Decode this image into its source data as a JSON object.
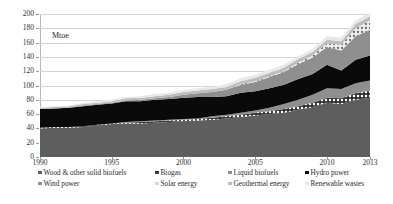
{
  "chart_data": {
    "type": "area",
    "stacked": true,
    "title": "",
    "unit_label": "Mtoe",
    "xlabel": "",
    "ylabel": "",
    "ylim": [
      0,
      200
    ],
    "ytick_step": 20,
    "ytick_labels": [
      "200",
      "180",
      "160",
      "140",
      "120",
      "100",
      "80",
      "60",
      "40",
      "20",
      "0"
    ],
    "ytick_values": [
      200,
      180,
      160,
      140,
      120,
      100,
      80,
      60,
      40,
      20,
      0
    ],
    "xlim": [
      1990,
      2013
    ],
    "xtick_labels": [
      "1990",
      "1995",
      "2000",
      "2005",
      "2010",
      "2013"
    ],
    "xtick_values": [
      1990,
      1995,
      2000,
      2005,
      2010,
      2013
    ],
    "grid": "horizontal",
    "legend_position": "bottom",
    "x": [
      1990,
      1991,
      1992,
      1993,
      1994,
      1995,
      1996,
      1997,
      1998,
      1999,
      2000,
      2001,
      2002,
      2003,
      2004,
      2005,
      2006,
      2007,
      2008,
      2009,
      2010,
      2011,
      2012,
      2013
    ],
    "series": [
      {
        "name": "Wood & other solid biofuels",
        "color": "#5e5e5e",
        "pattern": "solid",
        "values": [
          40,
          41,
          41,
          42,
          44,
          46,
          47,
          47,
          48,
          49,
          50,
          51,
          52,
          54,
          56,
          58,
          60,
          62,
          66,
          70,
          76,
          74,
          80,
          83
        ]
      },
      {
        "name": "Biogas",
        "color": "#3a3a3a",
        "pattern": "dotted",
        "values": [
          1,
          1,
          1,
          1,
          1,
          1,
          1,
          2,
          2,
          2,
          2,
          2,
          3,
          3,
          3,
          4,
          4,
          5,
          5,
          6,
          7,
          8,
          9,
          10
        ]
      },
      {
        "name": "Liquid biofuels",
        "color": "#8f8f8f",
        "pattern": "solid",
        "values": [
          0,
          0,
          0,
          0,
          0,
          0,
          1,
          1,
          1,
          1,
          1,
          1,
          2,
          2,
          3,
          3,
          5,
          7,
          9,
          11,
          13,
          13,
          14,
          14
        ]
      },
      {
        "name": "Hydro power",
        "color": "#0a0a0a",
        "pattern": "solid",
        "values": [
          26,
          26,
          27,
          28,
          28,
          28,
          29,
          28,
          29,
          29,
          30,
          30,
          27,
          26,
          28,
          27,
          27,
          27,
          29,
          29,
          33,
          26,
          33,
          35
        ]
      },
      {
        "name": "Wind power",
        "color": "#8f8f8f",
        "pattern": "solid",
        "values": [
          0,
          0,
          0,
          1,
          1,
          1,
          1,
          2,
          2,
          3,
          4,
          5,
          7,
          9,
          11,
          13,
          16,
          18,
          21,
          23,
          25,
          28,
          33,
          36
        ]
      },
      {
        "name": "Solar energy",
        "color": "#d8d8d8",
        "pattern": "speckle",
        "values": [
          0,
          0,
          0,
          0,
          0,
          0,
          0,
          0,
          0,
          0,
          0,
          0,
          0,
          0,
          1,
          1,
          1,
          1,
          2,
          3,
          5,
          8,
          11,
          13
        ]
      },
      {
        "name": "Geothermal energy",
        "color": "#bdbdbd",
        "pattern": "solid",
        "values": [
          2,
          2,
          2,
          2,
          2,
          2,
          3,
          3,
          3,
          3,
          4,
          4,
          4,
          4,
          4,
          5,
          5,
          5,
          5,
          5,
          5,
          5,
          6,
          6
        ]
      },
      {
        "name": "Renewable wastes",
        "color": "#e8e8e8",
        "pattern": "solid",
        "values": [
          1,
          1,
          1,
          2,
          2,
          2,
          2,
          2,
          3,
          3,
          3,
          3,
          3,
          4,
          4,
          4,
          4,
          4,
          4,
          4,
          5,
          5,
          5,
          5
        ]
      }
    ]
  },
  "legend": {
    "row1": [
      {
        "label": "Wood & other solid biofuels",
        "color": "#5e5e5e"
      },
      {
        "label": "Biogas",
        "color": "#3a3a3a"
      },
      {
        "label": "Liquid biofuels",
        "color": "#8f8f8f"
      },
      {
        "label": "Hydro power",
        "color": "#0a0a0a"
      }
    ],
    "row2": [
      {
        "label": "Wind power",
        "color": "#8f8f8f"
      },
      {
        "label": "Solar energy",
        "color": "#d8d8d8"
      },
      {
        "label": "Geothermal energy",
        "color": "#bdbdbd"
      },
      {
        "label": "Renewable wastes",
        "color": "#e8e8e8"
      }
    ]
  }
}
